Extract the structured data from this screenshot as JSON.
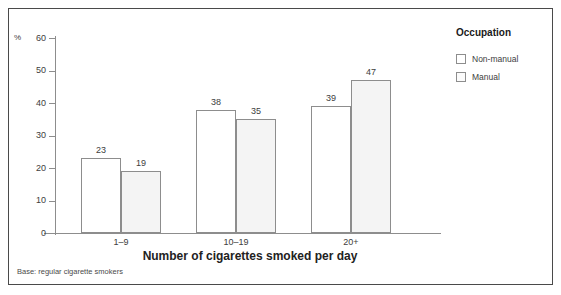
{
  "chart_data": {
    "type": "bar",
    "title": "",
    "subtitle": "",
    "categories": [
      "1–9",
      "10–19",
      "20+"
    ],
    "series": [
      {
        "name": "Non-manual",
        "values": [
          23,
          38,
          39
        ],
        "color": "#ffffff"
      },
      {
        "name": "Manual",
        "values": [
          19,
          35,
          47
        ],
        "color": "#f4f4f4"
      }
    ],
    "xlabel": "Number of cigarettes smoked per day",
    "ylabel": "",
    "y_unit_symbol": "%",
    "ylim": [
      0,
      60
    ],
    "y_ticks": [
      0,
      10,
      20,
      30,
      40,
      50,
      60
    ],
    "y_tick_labels": [
      "0",
      "10",
      "20",
      "30",
      "40",
      "50",
      "60"
    ],
    "grid": false,
    "legend_position": "right",
    "legend_title": "Occupation",
    "annotations": [
      "Base: regular cigarette smokers"
    ],
    "bar_value_labels": true
  },
  "legend": {
    "title": "Occupation",
    "items": [
      {
        "label": "Non-manual"
      },
      {
        "label": "Manual"
      }
    ]
  },
  "axes": {
    "x_title": "Number of cigarettes smoked per day",
    "percent_symbol": "%",
    "y_tick_labels": [
      "60",
      "50",
      "40",
      "30",
      "20",
      "10",
      "0"
    ],
    "category_labels": [
      "1–9",
      "10–19",
      "20+"
    ]
  },
  "footnote": {
    "text": "Base: regular cigarette smokers"
  }
}
